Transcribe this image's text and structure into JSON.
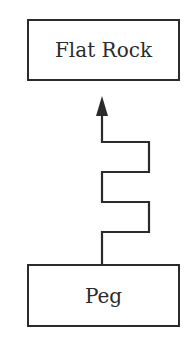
{
  "diagram": {
    "nodes": [
      {
        "id": "top",
        "label": "Flat Rock"
      },
      {
        "id": "bottom",
        "label": "Peg"
      }
    ],
    "edges": [
      {
        "from": "bottom",
        "to": "top",
        "style": "zigzag-arrow"
      }
    ],
    "colors": {
      "stroke": "#2b2b2b",
      "background": "#ffffff"
    }
  }
}
